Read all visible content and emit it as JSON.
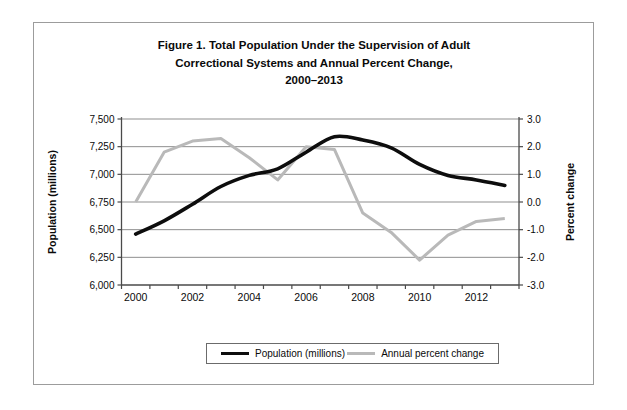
{
  "figure": {
    "title_lines": [
      "Figure 1. Total Population Under the Supervision of Adult",
      "Correctional Systems and Annual Percent Change,",
      "2000–2013"
    ]
  },
  "chart_data": {
    "type": "line",
    "title": "Figure 1. Total Population Under the Supervision of Adult Correctional Systems and Annual Percent Change, 2000–2013",
    "x": [
      2000,
      2001,
      2002,
      2003,
      2004,
      2005,
      2006,
      2007,
      2008,
      2009,
      2010,
      2011,
      2012,
      2013
    ],
    "series": [
      {
        "name": "Population (millions)",
        "axis": "left",
        "color": "#0d0d0d",
        "style": "smooth",
        "values": [
          6460,
          6580,
          6730,
          6890,
          6990,
          7050,
          7200,
          7340,
          7310,
          7240,
          7090,
          6990,
          6950,
          6900
        ]
      },
      {
        "name": "Annual percent change",
        "axis": "right",
        "color": "#b9b9b9",
        "style": "straight",
        "values": [
          0.0,
          1.8,
          2.2,
          2.3,
          1.6,
          0.8,
          2.0,
          1.9,
          -0.4,
          -1.1,
          -2.1,
          -1.2,
          -0.7,
          -0.6
        ]
      }
    ],
    "left_axis": {
      "label": "Population (millions)",
      "min": 6000,
      "max": 7500,
      "tick_values": [
        6000,
        6250,
        6500,
        6750,
        7000,
        7250,
        7500
      ],
      "tick_labels": [
        "6,000",
        "6,250",
        "6,500",
        "6,750",
        "7,000",
        "7,250",
        "7,500"
      ]
    },
    "right_axis": {
      "label": "Percent change",
      "min": -3.0,
      "max": 3.0,
      "tick_values": [
        -3,
        -2,
        -1,
        0,
        1,
        2,
        3
      ],
      "tick_labels": [
        "-3.0",
        "-2.0",
        "-1.0",
        "0.0",
        "1.0",
        "2.0",
        "3.0"
      ]
    },
    "x_axis": {
      "labeled_years": [
        2000,
        2002,
        2004,
        2006,
        2008,
        2010,
        2012
      ],
      "tick_labels": [
        "2000",
        "2002",
        "2004",
        "2006",
        "2008",
        "2010",
        "2012"
      ]
    },
    "legend": {
      "position": "bottom",
      "entries": [
        "Population (millions)",
        "Annual percent change"
      ]
    },
    "grid": true,
    "grid_color": "#8f8f8f",
    "axis_color": "#4a4a4a",
    "text_color": "#0a0a0a"
  }
}
